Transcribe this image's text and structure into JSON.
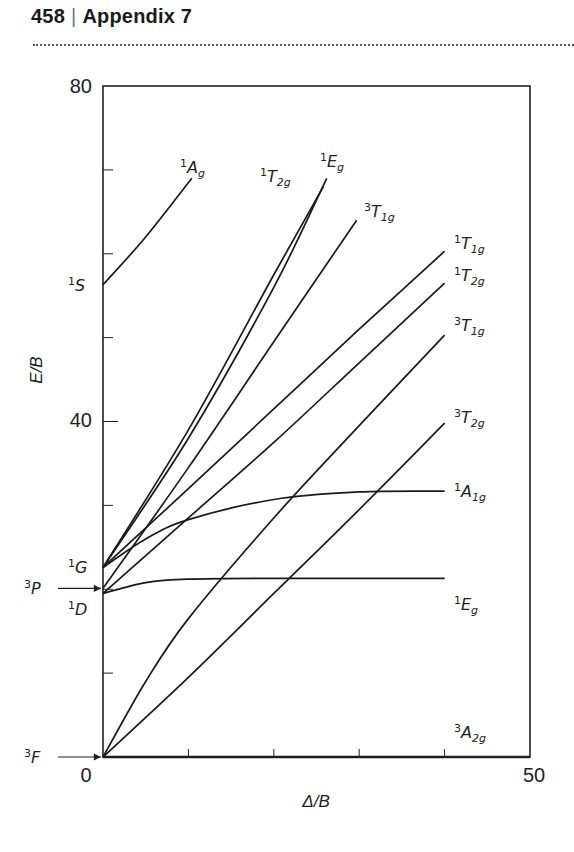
{
  "header": {
    "page_number": "458",
    "separator": "|",
    "title": "Appendix 7"
  },
  "chart_data": {
    "type": "line",
    "xlabel": "Δ/B",
    "ylabel": "E/B",
    "xlim": [
      0,
      50
    ],
    "ylim": [
      0,
      80
    ],
    "x_tick_labels": [
      "0",
      "50"
    ],
    "y_tick_labels": [
      "0",
      "40",
      "80"
    ],
    "x_minor_ticks": [
      10,
      20,
      30,
      40
    ],
    "y_minor_ticks": [
      10,
      20,
      30,
      50,
      60,
      70
    ],
    "grid": false,
    "free_ion_terms": [
      {
        "label": "3F",
        "sup": "3",
        "base": "F",
        "energy": 0,
        "arrow": true
      },
      {
        "label": "1D",
        "sup": "1",
        "base": "D",
        "energy": 19.5,
        "arrow": false
      },
      {
        "label": "3P",
        "sup": "3",
        "base": "P",
        "energy": 20.1,
        "arrow": true
      },
      {
        "label": "1G",
        "sup": "1",
        "base": "G",
        "energy": 22.6,
        "arrow": false
      },
      {
        "label": "1S",
        "sup": "1",
        "base": "S",
        "energy": 56.3,
        "arrow": false
      }
    ],
    "series": [
      {
        "name": "3A2g",
        "sup": "3",
        "base": "A",
        "sub": "2g",
        "x": [
          0,
          40
        ],
        "y": [
          0,
          0
        ]
      },
      {
        "name": "3T2g",
        "sup": "3",
        "base": "T",
        "sub": "2g",
        "x": [
          0,
          10,
          20,
          30,
          40
        ],
        "y": [
          0,
          9.5,
          19.5,
          29.5,
          39.8
        ]
      },
      {
        "name": "3T1g (F)",
        "sup": "3",
        "base": "T",
        "sub": "1g",
        "x": [
          0,
          5,
          10,
          20,
          30,
          40
        ],
        "y": [
          0,
          9.0,
          16.5,
          28.5,
          39.5,
          50.3
        ]
      },
      {
        "name": "1Eg",
        "sup": "1",
        "base": "E",
        "sub": "g",
        "x": [
          0,
          5,
          10,
          20,
          30,
          40
        ],
        "y": [
          19.5,
          20.8,
          21.2,
          21.3,
          21.3,
          21.3
        ]
      },
      {
        "name": "1A1g",
        "sup": "1",
        "base": "A",
        "sub": "1g",
        "x": [
          0,
          5,
          10,
          20,
          30,
          40
        ],
        "y": [
          22.6,
          26.0,
          28.3,
          30.7,
          31.6,
          31.7
        ]
      },
      {
        "name": "1T2g",
        "sup": "1",
        "base": "T",
        "sub": "2g",
        "x": [
          0,
          10,
          20,
          30,
          40
        ],
        "y": [
          19.5,
          28.5,
          37.5,
          47.0,
          56.5
        ]
      },
      {
        "name": "1T1g",
        "sup": "1",
        "base": "T",
        "sub": "1g",
        "x": [
          0,
          10,
          20,
          30,
          40
        ],
        "y": [
          22.6,
          32.0,
          41.5,
          51.0,
          60.3
        ]
      },
      {
        "name": "3T1g (P)",
        "sup": "3",
        "base": "T",
        "sub": "1g",
        "x": [
          0,
          10,
          20,
          29.7
        ],
        "y": [
          20.1,
          34.5,
          49.5,
          64.0
        ]
      },
      {
        "name": "1T2g (G)",
        "sup": "1",
        "base": "T",
        "sub": "2g",
        "x": [
          0,
          10,
          20,
          25.8
        ],
        "y": [
          22.6,
          39.0,
          57.5,
          68.0
        ]
      },
      {
        "name": "1Eg (G)",
        "sup": "1",
        "base": "E",
        "sub": "g",
        "x": [
          0,
          10,
          20,
          26.2
        ],
        "y": [
          22.6,
          38.0,
          56.0,
          69.0
        ]
      },
      {
        "name": "1Ag",
        "sup": "1",
        "base": "A",
        "sub": "g",
        "x": [
          0,
          5,
          10.4
        ],
        "y": [
          56.3,
          62.0,
          69.0
        ]
      }
    ]
  },
  "labels": {
    "y_top": "80",
    "y_mid": "40",
    "x_zero": "0",
    "x_max": "50",
    "xlabel": "Δ/B",
    "ylabel": "E/B"
  }
}
